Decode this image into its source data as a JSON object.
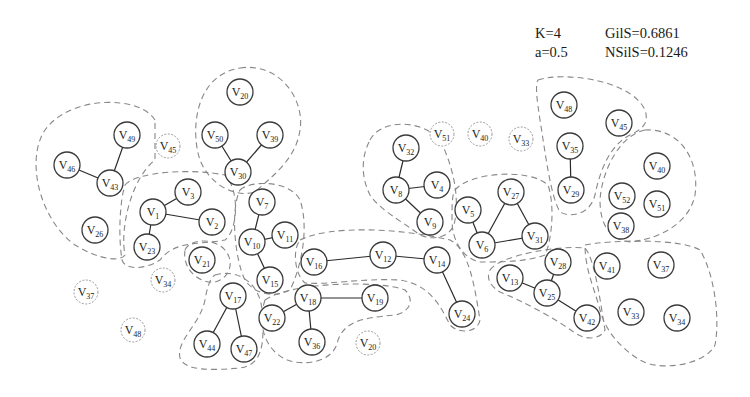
{
  "stats": {
    "k_label": "K=4",
    "a_label": "a=0.5",
    "gils_label": "GilS=0.6861",
    "nsils_label": "NSilS=0.1246"
  },
  "diagram": {
    "node_radius": 13,
    "nodes": [
      {
        "id": "46",
        "x": 67,
        "y": 165
      },
      {
        "id": "49",
        "x": 127,
        "y": 135
      },
      {
        "id": "43",
        "x": 110,
        "y": 183
      },
      {
        "id": "26",
        "x": 95,
        "y": 230
      },
      {
        "id": "45",
        "x": 168,
        "y": 146,
        "iso": true
      },
      {
        "id": "20",
        "x": 240,
        "y": 92
      },
      {
        "id": "50",
        "x": 215,
        "y": 135
      },
      {
        "id": "39",
        "x": 270,
        "y": 135
      },
      {
        "id": "30",
        "x": 238,
        "y": 172
      },
      {
        "id": "3",
        "x": 188,
        "y": 192
      },
      {
        "id": "1",
        "x": 153,
        "y": 212
      },
      {
        "id": "2",
        "x": 212,
        "y": 222
      },
      {
        "id": "23",
        "x": 147,
        "y": 247
      },
      {
        "id": "7",
        "x": 262,
        "y": 202
      },
      {
        "id": "10",
        "x": 252,
        "y": 242
      },
      {
        "id": "11",
        "x": 285,
        "y": 235
      },
      {
        "id": "15",
        "x": 270,
        "y": 280
      },
      {
        "id": "21",
        "x": 202,
        "y": 260
      },
      {
        "id": "34",
        "x": 163,
        "y": 280,
        "iso": true
      },
      {
        "id": "37",
        "x": 86,
        "y": 292,
        "iso": true
      },
      {
        "id": "48",
        "x": 133,
        "y": 330,
        "iso": true
      },
      {
        "id": "17",
        "x": 233,
        "y": 296
      },
      {
        "id": "44",
        "x": 207,
        "y": 344
      },
      {
        "id": "47",
        "x": 244,
        "y": 349
      },
      {
        "id": "16",
        "x": 314,
        "y": 262
      },
      {
        "id": "12",
        "x": 383,
        "y": 255
      },
      {
        "id": "14",
        "x": 437,
        "y": 260
      },
      {
        "id": "24",
        "x": 462,
        "y": 314
      },
      {
        "id": "22",
        "x": 272,
        "y": 318
      },
      {
        "id": "18",
        "x": 308,
        "y": 298
      },
      {
        "id": "19",
        "x": 375,
        "y": 298
      },
      {
        "id": "36",
        "x": 312,
        "y": 342
      },
      {
        "id": "20b",
        "label": "20",
        "x": 368,
        "y": 343,
        "iso": true
      },
      {
        "id": "32",
        "x": 406,
        "y": 148
      },
      {
        "id": "8",
        "x": 396,
        "y": 190
      },
      {
        "id": "4",
        "x": 437,
        "y": 185
      },
      {
        "id": "9",
        "x": 430,
        "y": 222
      },
      {
        "id": "51",
        "x": 442,
        "y": 134,
        "iso": true
      },
      {
        "id": "40",
        "x": 480,
        "y": 134,
        "iso": true
      },
      {
        "id": "33",
        "x": 521,
        "y": 139,
        "iso": true
      },
      {
        "id": "5",
        "x": 468,
        "y": 210
      },
      {
        "id": "27",
        "x": 511,
        "y": 192
      },
      {
        "id": "6",
        "x": 482,
        "y": 245
      },
      {
        "id": "31",
        "x": 535,
        "y": 236
      },
      {
        "id": "48b",
        "label": "48",
        "x": 564,
        "y": 105
      },
      {
        "id": "45b",
        "label": "45",
        "x": 619,
        "y": 123
      },
      {
        "id": "35",
        "x": 570,
        "y": 146
      },
      {
        "id": "29",
        "x": 571,
        "y": 190
      },
      {
        "id": "40b",
        "label": "40",
        "x": 657,
        "y": 166
      },
      {
        "id": "52",
        "x": 622,
        "y": 196
      },
      {
        "id": "51b",
        "label": "51",
        "x": 657,
        "y": 204
      },
      {
        "id": "38",
        "x": 621,
        "y": 226
      },
      {
        "id": "13",
        "x": 510,
        "y": 278
      },
      {
        "id": "28",
        "x": 558,
        "y": 262
      },
      {
        "id": "25",
        "x": 547,
        "y": 293
      },
      {
        "id": "42",
        "x": 587,
        "y": 318
      },
      {
        "id": "41",
        "x": 607,
        "y": 266
      },
      {
        "id": "37b",
        "label": "37",
        "x": 661,
        "y": 265
      },
      {
        "id": "33b",
        "label": "33",
        "x": 631,
        "y": 312
      },
      {
        "id": "34b",
        "label": "34",
        "x": 677,
        "y": 318
      }
    ],
    "edges": [
      [
        "46",
        "43"
      ],
      [
        "49",
        "43"
      ],
      [
        "50",
        "30"
      ],
      [
        "39",
        "30"
      ],
      [
        "1",
        "3"
      ],
      [
        "1",
        "2"
      ],
      [
        "1",
        "23"
      ],
      [
        "7",
        "10"
      ],
      [
        "10",
        "11"
      ],
      [
        "10",
        "15"
      ],
      [
        "17",
        "44"
      ],
      [
        "17",
        "47"
      ],
      [
        "16",
        "12"
      ],
      [
        "12",
        "14"
      ],
      [
        "14",
        "24"
      ],
      [
        "22",
        "18"
      ],
      [
        "18",
        "19"
      ],
      [
        "18",
        "36"
      ],
      [
        "32",
        "8"
      ],
      [
        "8",
        "4"
      ],
      [
        "8",
        "9"
      ],
      [
        "5",
        "6"
      ],
      [
        "6",
        "27"
      ],
      [
        "27",
        "31"
      ],
      [
        "6",
        "31"
      ],
      [
        "35",
        "29"
      ],
      [
        "13",
        "25"
      ],
      [
        "28",
        "25"
      ],
      [
        "25",
        "42"
      ]
    ],
    "clusters": [
      {
        "name": "cluster-v46-v49-v43-v26",
        "path": "M 155 120 C 140 95, 70 95, 45 130 C 25 160, 40 220, 75 245 C 100 260, 120 262, 125 255 C 120 230, 130 180, 155 160 Z"
      },
      {
        "name": "cluster-v20-v50-v39-v30",
        "path": "M 240 68 C 280 62, 305 100, 300 130 C 296 160, 270 178, 255 192 C 235 198, 210 185, 200 160 C 190 130, 195 75, 240 68 Z"
      },
      {
        "name": "cluster-v3-v1-v2-v23",
        "path": "M 125 185 C 135 172, 190 168, 225 175 C 240 190, 238 230, 225 240 C 200 245, 175 240, 160 260 C 145 270, 125 270, 122 260 C 118 235, 120 200, 125 185 Z"
      },
      {
        "name": "cluster-v7-v10-v11-v15",
        "path": "M 240 190 C 250 180, 290 180, 300 200 C 310 230, 300 270, 290 290 C 275 298, 255 295, 245 280 C 235 260, 230 210, 240 190 Z"
      },
      {
        "name": "cluster-v21",
        "path": "M 185 250 C 190 238, 215 238, 225 250 C 235 262, 230 278, 215 282 C 200 284, 182 270, 185 250 Z"
      },
      {
        "name": "cluster-v17-v44-v47",
        "path": "M 215 275 C 240 268, 260 285, 262 310 C 265 345, 262 365, 240 368 C 215 370, 185 372, 180 358 C 176 340, 200 325, 205 300 C 207 288, 210 278, 215 275 Z"
      },
      {
        "name": "cluster-v16-v12-v14-v24",
        "path": "M 300 240 C 330 225, 400 228, 450 240 C 470 250, 475 290, 480 320 C 478 332, 460 335, 450 325 C 440 305, 430 285, 400 280 C 360 278, 330 285, 305 283 C 295 275, 292 250, 300 240 Z"
      },
      {
        "name": "cluster-v22-v18-v19-v36",
        "path": "M 265 300 C 290 282, 380 280, 405 290 C 415 300, 410 312, 395 315 C 360 318, 345 322, 338 340 C 335 358, 315 365, 295 362 C 270 358, 255 330, 265 300 Z"
      },
      {
        "name": "cluster-v32-v8-v4-v9",
        "path": "M 370 140 C 380 120, 420 118, 440 140 C 450 160, 460 190, 455 220 C 452 240, 430 240, 420 235 C 400 220, 380 210, 370 195 C 360 175, 362 155, 370 140 Z"
      },
      {
        "name": "cluster-v5-v27-v6-v31",
        "path": "M 455 190 C 470 172, 530 168, 548 185 C 555 205, 552 240, 545 255 C 525 262, 500 262, 480 262 C 462 258, 452 240, 452 220 C 452 205, 452 195, 455 190 Z"
      },
      {
        "name": "cluster-v48-v35-v29-v45",
        "path": "M 538 80 C 560 72, 630 78, 645 110 C 650 125, 640 130, 630 135 C 610 145, 600 170, 595 195 C 590 215, 570 218, 560 212 C 550 195, 545 150, 540 120 C 537 100, 535 85, 538 80 Z"
      },
      {
        "name": "cluster-v40-v52-v51-v38",
        "path": "M 645 130 C 680 128, 700 160, 695 195 C 690 220, 665 238, 630 242 C 610 240, 600 225, 600 200 C 602 170, 620 135, 645 130 Z"
      },
      {
        "name": "cluster-v13-v28-v25-v42",
        "path": "M 490 270 C 500 255, 560 245, 585 248 C 595 260, 600 300, 605 330 C 600 340, 585 340, 575 333 C 555 318, 520 300, 500 292 C 490 286, 486 278, 490 270 Z"
      },
      {
        "name": "cluster-v41-v37-v33-v34",
        "path": "M 585 245 C 610 240, 680 238, 700 250 C 715 275, 720 320, 715 345 C 705 365, 660 372, 640 360 C 620 348, 605 330, 600 310 C 595 290, 585 270, 585 245 Z"
      }
    ]
  }
}
